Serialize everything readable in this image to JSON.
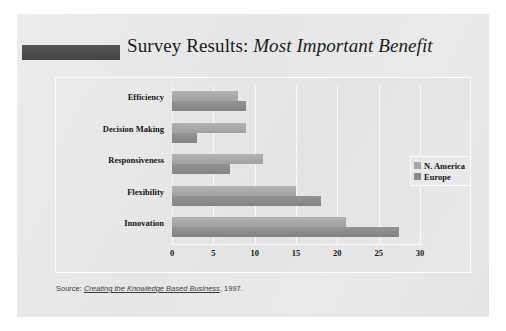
{
  "slide": {
    "title_plain": "Survey Results:",
    "title_italic": "Most Important Benefit",
    "accent_bar": "dark-gray-accent",
    "background_color": "#e9e9e9"
  },
  "source": {
    "prefix": "Source:",
    "work_title": "Creating the Knowledge Based Business",
    "suffix": ", 1997."
  },
  "legend": {
    "items": [
      {
        "label": "N. America",
        "color": "#a8a8a8"
      },
      {
        "label": "Europe",
        "color": "#8a8a8a"
      }
    ]
  },
  "chart_data": {
    "type": "bar",
    "orientation": "horizontal",
    "title": "Survey Results: Most Important Benefit",
    "xlabel": "",
    "ylabel": "",
    "xlim": [
      0,
      30
    ],
    "xticks": [
      0,
      5,
      10,
      15,
      20,
      25,
      30
    ],
    "xtick_labels": [
      "0",
      "5",
      "10",
      "15",
      "20",
      "25",
      "30"
    ],
    "grid": true,
    "legend_position": "right",
    "categories": [
      "Efficiency",
      "Decision Making",
      "Responsiveness",
      "Flexibility",
      "Innovation"
    ],
    "series": [
      {
        "name": "N. America",
        "color": "#a8a8a8",
        "values": [
          8,
          9,
          11,
          15,
          21
        ]
      },
      {
        "name": "Europe",
        "color": "#8a8a8a",
        "values": [
          9,
          3,
          7,
          18,
          27.5
        ]
      }
    ]
  }
}
